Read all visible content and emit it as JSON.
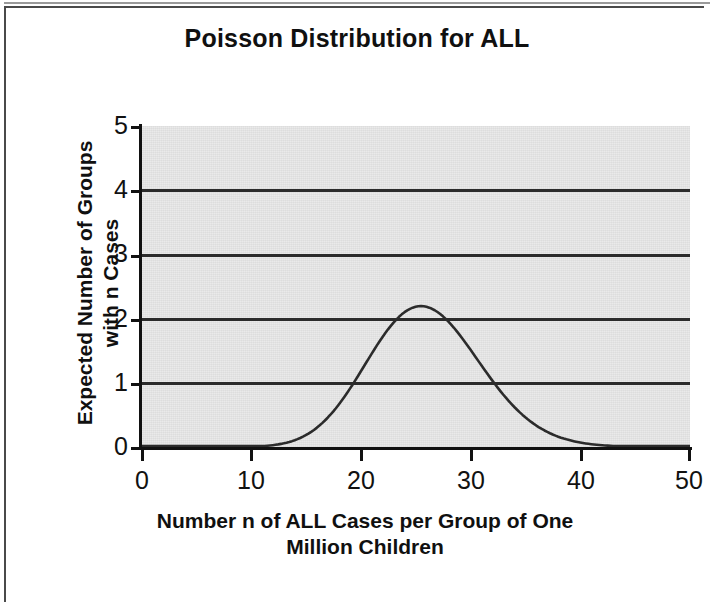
{
  "figure": {
    "title": "Poisson Distribution for ALL",
    "background_color": "#ffffff",
    "plot_background_color": "#e9e9e9",
    "line_color": "#2b2b2b",
    "gridline_color": "#2b2b2b",
    "axis_color": "#111111"
  },
  "chart_data": {
    "type": "line",
    "title": "Poisson Distribution for ALL",
    "subtitle": "",
    "xlabel": "Number n of ALL Cases per Group of One Million Children",
    "xlabel_line1": "Number n of ALL Cases per Group of One",
    "xlabel_line2": "Million Children",
    "ylabel": "Expected Number of Groups with n Cases",
    "ylabel_line1": "Expected Number of Groups",
    "ylabel_line2": "with n Cases",
    "xlim": [
      0,
      50
    ],
    "ylim": [
      0,
      5
    ],
    "xticks": [
      0,
      10,
      20,
      30,
      40,
      50
    ],
    "xtick_labels": [
      "0",
      "10",
      "20",
      "30",
      "40",
      "50"
    ],
    "yticks": [
      0,
      1,
      2,
      3,
      4,
      5
    ],
    "ytick_labels": [
      "0",
      "1",
      "2",
      "3",
      "4",
      "5"
    ],
    "grid": "horizontal",
    "legend": null,
    "distribution": {
      "family": "Poisson",
      "lambda": 26,
      "scale_groups": 28,
      "peak_x": 26,
      "peak_y": 4.3
    },
    "x": [
      0,
      1,
      2,
      3,
      4,
      5,
      6,
      7,
      8,
      9,
      10,
      11,
      12,
      13,
      14,
      15,
      16,
      17,
      18,
      19,
      20,
      21,
      22,
      23,
      24,
      25,
      26,
      27,
      28,
      29,
      30,
      31,
      32,
      33,
      34,
      35,
      36,
      37,
      38,
      39,
      40,
      41,
      42,
      43,
      44,
      45,
      46,
      47,
      48,
      49,
      50
    ],
    "values": [
      0.0,
      0.0,
      0.0,
      0.0,
      0.0,
      0.0,
      0.0,
      0.0,
      0.0,
      0.01,
      0.02,
      0.04,
      0.08,
      0.17,
      0.31,
      0.54,
      0.88,
      1.34,
      1.94,
      2.65,
      3.45,
      4.01,
      4.24,
      4.31,
      4.33,
      4.32,
      4.33,
      4.17,
      3.87,
      3.47,
      3.01,
      2.52,
      2.05,
      1.61,
      1.23,
      0.91,
      0.66,
      0.46,
      0.32,
      0.21,
      0.14,
      0.12,
      0.09,
      0.06,
      0.04,
      0.03,
      0.02,
      0.01,
      0.01,
      0.0,
      0.0
    ],
    "series": [
      {
        "name": "Expected number of groups",
        "values": [
          0.0,
          0.0,
          0.0,
          0.0,
          0.0,
          0.0,
          0.0,
          0.0,
          0.0,
          0.01,
          0.02,
          0.04,
          0.08,
          0.17,
          0.31,
          0.54,
          0.88,
          1.34,
          1.94,
          2.65,
          3.45,
          4.01,
          4.24,
          4.31,
          4.33,
          4.32,
          4.33,
          4.17,
          3.87,
          3.47,
          3.01,
          2.52,
          2.05,
          1.61,
          1.23,
          0.91,
          0.66,
          0.46,
          0.32,
          0.21,
          0.14,
          0.12,
          0.09,
          0.06,
          0.04,
          0.03,
          0.02,
          0.01,
          0.01,
          0.0,
          0.0
        ]
      }
    ]
  }
}
